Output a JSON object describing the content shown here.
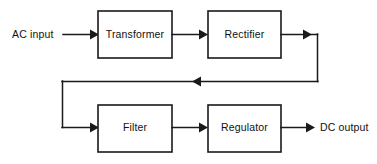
{
  "diagram": {
    "type": "block-flow-diagram",
    "colors": {
      "background": "#ffffff",
      "stroke": "#1a1a1a",
      "text": "#111111"
    },
    "blocks": [
      {
        "id": "transformer",
        "label": "Transformer",
        "x": 98,
        "y": 11,
        "w": 74,
        "h": 47
      },
      {
        "id": "rectifier",
        "label": "Rectifier",
        "x": 208,
        "y": 11,
        "w": 73,
        "h": 47
      },
      {
        "id": "filter",
        "label": "Filter",
        "x": 98,
        "y": 105,
        "w": 74,
        "h": 47
      },
      {
        "id": "regulator",
        "label": "Regulator",
        "x": 208,
        "y": 105,
        "w": 73,
        "h": 47
      }
    ],
    "io_labels": [
      {
        "id": "ac-input",
        "label": "AC input",
        "x": 12,
        "y": 34
      },
      {
        "id": "dc-output",
        "label": "DC output",
        "x": 320,
        "y": 128
      }
    ],
    "connections": [
      {
        "id": "input-to-transformer",
        "from": "AC input",
        "to": "Transformer"
      },
      {
        "id": "transformer-to-rectifier",
        "from": "Transformer",
        "to": "Rectifier"
      },
      {
        "id": "rectifier-to-filter",
        "from": "Rectifier",
        "to": "Filter"
      },
      {
        "id": "filter-to-regulator",
        "from": "Filter",
        "to": "Regulator"
      },
      {
        "id": "regulator-to-output",
        "from": "Regulator",
        "to": "DC output"
      }
    ]
  }
}
